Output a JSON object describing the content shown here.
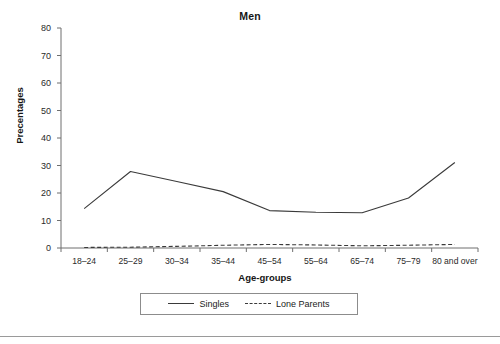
{
  "chart_data": {
    "type": "line",
    "title": "Men",
    "xlabel": "Age-groups",
    "ylabel": "Precentages",
    "categories": [
      "18–24",
      "25–29",
      "30–34",
      "35–44",
      "45–54",
      "55–64",
      "65–74",
      "75–79",
      "80 and over"
    ],
    "series": [
      {
        "name": "Singles",
        "style": "solid",
        "color": "#3a3a3a",
        "values": [
          14.3,
          27.8,
          24.2,
          20.5,
          13.6,
          13.0,
          12.8,
          18.2,
          31.1
        ]
      },
      {
        "name": "Lone Parents",
        "style": "dashed",
        "color": "#3a3a3a",
        "values": [
          0.2,
          0.3,
          0.6,
          1.0,
          1.3,
          1.1,
          0.8,
          1.0,
          1.3
        ]
      }
    ],
    "ylim": [
      0,
      80
    ],
    "yticks": [
      0,
      10,
      20,
      30,
      40,
      50,
      60,
      70,
      80
    ],
    "ytick_labels": [
      "0",
      "10",
      "20",
      "30",
      "40",
      "50",
      "60",
      "70",
      "80"
    ],
    "grid": false,
    "legend_position": "bottom",
    "legend_entries": [
      "Singles",
      "Lone Parents"
    ]
  },
  "axis_colors": {
    "axis": "#6f6f6f",
    "line": "#3a3a3a",
    "text": "#1a1a1a"
  }
}
